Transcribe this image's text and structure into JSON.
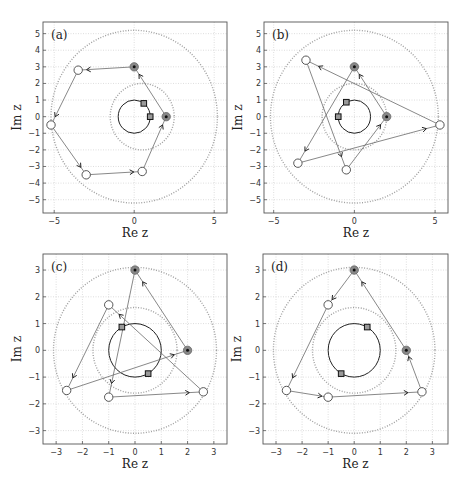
{
  "figure": {
    "width": 467,
    "height": 482,
    "colors": {
      "frame": "#555555",
      "grid": "#c8c8c8",
      "dotted_circle": "#a0a0a0",
      "unit_circle": "#222222",
      "path_line": "#6a6a6a",
      "open_marker": "#555555",
      "filled_marker": "#888888",
      "filled_center": "#111111",
      "square_fill": "#999999",
      "square_edge": "#111111"
    }
  },
  "chart_data": [
    {
      "id": "a",
      "type": "scatter",
      "panel_label": "(a)",
      "xlabel": "Re z",
      "ylabel": "Im z",
      "xlim": [
        -5.7,
        5.8
      ],
      "ylim": [
        -5.8,
        5.7
      ],
      "xticks": [
        -5,
        0,
        5
      ],
      "yticks": [
        -5,
        -4,
        -3,
        -2,
        -1,
        0,
        1,
        2,
        3,
        4,
        5
      ],
      "grid": true,
      "frame_px": {
        "x0": 43,
        "x1": 227,
        "y0": 22,
        "y1": 213
      },
      "unit_circle": {
        "cx": 0,
        "cy": 0,
        "r": 1
      },
      "dotted_circles": [
        {
          "cx": 0.5,
          "cy": 0,
          "r": 2.0
        },
        {
          "cx": 0,
          "cy": 0,
          "r": 5.2
        }
      ],
      "filled_points": [
        [
          2,
          0
        ],
        [
          0,
          3
        ]
      ],
      "open_points": [
        [
          -3.5,
          2.8
        ],
        [
          -5.2,
          -0.5
        ],
        [
          -3.0,
          -3.5
        ],
        [
          0.5,
          -3.3
        ]
      ],
      "squares": [
        [
          0.6,
          0.8
        ],
        [
          1.0,
          0
        ]
      ],
      "path_segments": [
        [
          [
            2,
            0
          ],
          [
            0,
            3
          ]
        ],
        [
          [
            0,
            3
          ],
          [
            -3.5,
            2.8
          ]
        ],
        [
          [
            -3.5,
            2.8
          ],
          [
            -5.2,
            -0.5
          ]
        ],
        [
          [
            -5.2,
            -0.5
          ],
          [
            -3.0,
            -3.5
          ]
        ],
        [
          [
            -3.0,
            -3.5
          ],
          [
            0.5,
            -3.3
          ]
        ],
        [
          [
            0.5,
            -3.3
          ],
          [
            2,
            0
          ]
        ]
      ]
    },
    {
      "id": "b",
      "type": "scatter",
      "panel_label": "(b)",
      "xlabel": "Re z",
      "ylabel": "Im z",
      "xlim": [
        -5.6,
        5.8
      ],
      "ylim": [
        -5.8,
        5.7
      ],
      "xticks": [
        -5,
        0,
        5
      ],
      "yticks": [
        -5,
        -4,
        -3,
        -2,
        -1,
        0,
        1,
        2,
        3,
        4,
        5
      ],
      "grid": true,
      "frame_px": {
        "x0": 264,
        "x1": 448,
        "y0": 22,
        "y1": 213
      },
      "unit_circle": {
        "cx": 0,
        "cy": 0,
        "r": 1
      },
      "dotted_circles": [
        {
          "cx": 0,
          "cy": 0,
          "r": 2.0
        },
        {
          "cx": 0,
          "cy": 0,
          "r": 5.2
        }
      ],
      "filled_points": [
        [
          2,
          0
        ],
        [
          0,
          3
        ]
      ],
      "open_points": [
        [
          5.3,
          -0.5
        ],
        [
          -3.0,
          3.4
        ],
        [
          -0.5,
          -3.2
        ],
        [
          -3.5,
          -2.8
        ]
      ],
      "squares": [
        [
          -0.5,
          0.87
        ],
        [
          -1.0,
          0
        ]
      ],
      "path_segments": [
        [
          [
            2,
            0
          ],
          [
            0,
            3
          ]
        ],
        [
          [
            0,
            3
          ],
          [
            -3.5,
            -2.8
          ]
        ],
        [
          [
            -3.5,
            -2.8
          ],
          [
            5.3,
            -0.5
          ]
        ],
        [
          [
            5.3,
            -0.5
          ],
          [
            -3.0,
            3.4
          ]
        ],
        [
          [
            -3.0,
            3.4
          ],
          [
            -0.5,
            -3.2
          ]
        ],
        [
          [
            -0.5,
            -3.2
          ],
          [
            2,
            0
          ]
        ]
      ]
    },
    {
      "id": "c",
      "type": "scatter",
      "panel_label": "(c)",
      "xlabel": "Re z",
      "ylabel": "Im z",
      "xlim": [
        -3.5,
        3.5
      ],
      "ylim": [
        -3.5,
        3.6
      ],
      "xticks": [
        -3,
        -2,
        -1,
        0,
        1,
        2,
        3
      ],
      "yticks": [
        -3,
        -2,
        -1,
        0,
        1,
        2,
        3
      ],
      "grid": true,
      "frame_px": {
        "x0": 43,
        "x1": 227,
        "y0": 254,
        "y1": 444
      },
      "unit_circle": {
        "cx": 0,
        "cy": 0,
        "r": 1
      },
      "dotted_circles": [
        {
          "cx": 0,
          "cy": 0,
          "r": 1.6
        },
        {
          "cx": 0,
          "cy": 0,
          "r": 3.1
        }
      ],
      "filled_points": [
        [
          2,
          0
        ],
        [
          0,
          3
        ]
      ],
      "open_points": [
        [
          -1.0,
          1.7
        ],
        [
          -2.6,
          -1.5
        ],
        [
          -1.0,
          -1.75
        ],
        [
          2.6,
          -1.55
        ]
      ],
      "squares": [
        [
          -0.5,
          0.87
        ],
        [
          0.5,
          -0.87
        ]
      ],
      "path_segments": [
        [
          [
            2,
            0
          ],
          [
            0,
            3
          ]
        ],
        [
          [
            0,
            3
          ],
          [
            -1.0,
            -1.75
          ]
        ],
        [
          [
            -1.0,
            -1.75
          ],
          [
            2.6,
            -1.55
          ]
        ],
        [
          [
            2.6,
            -1.55
          ],
          [
            -1.0,
            1.7
          ]
        ],
        [
          [
            -1.0,
            1.7
          ],
          [
            -2.6,
            -1.5
          ]
        ],
        [
          [
            -2.6,
            -1.5
          ],
          [
            2,
            0
          ]
        ]
      ]
    },
    {
      "id": "d",
      "type": "scatter",
      "panel_label": "(d)",
      "xlabel": "Re z",
      "ylabel": "Im z",
      "xlim": [
        -3.5,
        3.6
      ],
      "ylim": [
        -3.5,
        3.6
      ],
      "xticks": [
        -3,
        -2,
        -1,
        0,
        1,
        2,
        3
      ],
      "yticks": [
        -3,
        -2,
        -1,
        0,
        1,
        2,
        3
      ],
      "grid": true,
      "frame_px": {
        "x0": 263,
        "x1": 448,
        "y0": 254,
        "y1": 444
      },
      "unit_circle": {
        "cx": 0,
        "cy": 0,
        "r": 1
      },
      "dotted_circles": [
        {
          "cx": 0,
          "cy": 0,
          "r": 1.6
        },
        {
          "cx": 0,
          "cy": 0,
          "r": 3.1
        }
      ],
      "filled_points": [
        [
          2,
          0
        ],
        [
          0,
          3
        ]
      ],
      "open_points": [
        [
          -1.0,
          1.7
        ],
        [
          -2.6,
          -1.5
        ],
        [
          -1.0,
          -1.75
        ],
        [
          2.6,
          -1.55
        ]
      ],
      "squares": [
        [
          0.5,
          0.87
        ],
        [
          -0.5,
          -0.87
        ]
      ],
      "path_segments": [
        [
          [
            0,
            3
          ],
          [
            -1.0,
            1.7
          ]
        ],
        [
          [
            -1.0,
            1.7
          ],
          [
            -2.6,
            -1.5
          ]
        ],
        [
          [
            -2.6,
            -1.5
          ],
          [
            -1.0,
            -1.75
          ]
        ],
        [
          [
            -1.0,
            -1.75
          ],
          [
            2.6,
            -1.55
          ]
        ],
        [
          [
            2.6,
            -1.55
          ],
          [
            2,
            0
          ]
        ],
        [
          [
            2,
            0
          ],
          [
            0,
            3
          ]
        ]
      ]
    }
  ]
}
